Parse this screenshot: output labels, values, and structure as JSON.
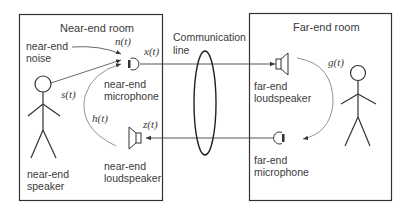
{
  "near_room": {
    "title": "Near-end room",
    "noise_label_line1": "near-end",
    "noise_label_line2": "noise",
    "mic_label_line1": "near-end",
    "mic_label_line2": "microphone",
    "speaker_label_line1": "near-end",
    "speaker_label_line2": "loudspeaker",
    "person_label_line1": "near-end",
    "person_label_line2": "speaker"
  },
  "far_room": {
    "title": "Far-end room",
    "speaker_label_line1": "far-end",
    "speaker_label_line2": "loudspeaker",
    "mic_label_line1": "far-end",
    "mic_label_line2": "microphone"
  },
  "channel": {
    "label_line1": "Communication",
    "label_line2": "line"
  },
  "signals": {
    "noise": "n(t)",
    "mic_out": "x(t)",
    "speech": "s(t)",
    "echo_path": "h(t)",
    "far_in": "z(t)",
    "far_echo_path": "g(t)"
  },
  "colors": {
    "line": "#333333",
    "arc": "#777777"
  }
}
